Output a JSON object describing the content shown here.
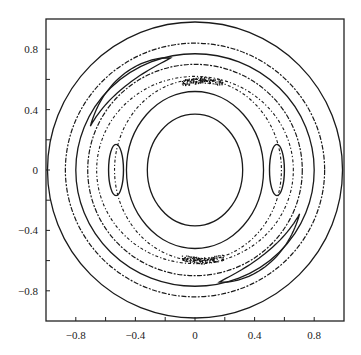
{
  "chart_data": {
    "type": "scatter",
    "title": "",
    "xlabel": "",
    "ylabel": "",
    "xlim": [
      -1.0,
      1.0
    ],
    "ylim": [
      -1.0,
      1.0
    ],
    "grid": false,
    "legend": null,
    "x_ticks": [
      -0.8,
      -0.6,
      -0.4,
      -0.2,
      0,
      0.2,
      0.4,
      0.6,
      0.8
    ],
    "x_tick_labels": [
      "−0.8",
      "−0.4",
      "0",
      "0.4",
      "0.8"
    ],
    "x_tick_label_values": [
      -0.8,
      -0.4,
      0,
      0.4,
      0.8
    ],
    "y_ticks": [
      -0.8,
      -0.6,
      -0.4,
      -0.2,
      0,
      0.2,
      0.4,
      0.6,
      0.8
    ],
    "y_tick_labels": [
      "0.8",
      "0.4",
      "0",
      "−0.4",
      "−0.8"
    ],
    "y_tick_label_values": [
      0.8,
      0.4,
      0,
      -0.4,
      -0.8
    ],
    "curves": [
      {
        "name": "inner-orbit-1",
        "style": "solid",
        "cx": 0.0,
        "cy": 0.0,
        "rx": 0.32,
        "ry": 0.37
      },
      {
        "name": "inner-orbit-2",
        "style": "solid",
        "cx": 0.0,
        "cy": 0.0,
        "rx": 0.46,
        "ry": 0.52
      },
      {
        "name": "separatrix-inner",
        "style": "dotted",
        "cx": 0.02,
        "cy": 0.0,
        "rx": 0.56,
        "ry": 0.6
      },
      {
        "name": "separatrix-outer",
        "style": "dotted",
        "cx": 0.0,
        "cy": 0.0,
        "rx": 0.66,
        "ry": 0.62
      },
      {
        "name": "ring-1",
        "style": "dashed",
        "cx": 0.0,
        "cy": 0.0,
        "rx": 0.72,
        "ry": 0.7
      },
      {
        "name": "ring-2",
        "style": "solid",
        "cx": 0.0,
        "cy": 0.0,
        "rx": 0.8,
        "ry": 0.77
      },
      {
        "name": "ring-3",
        "style": "dashed",
        "cx": 0.0,
        "cy": 0.0,
        "rx": 0.87,
        "ry": 0.84
      },
      {
        "name": "outer-orbit",
        "style": "solid",
        "cx": 0.0,
        "cy": 0.0,
        "rx": 0.99,
        "ry": 0.98
      }
    ],
    "islands": [
      {
        "name": "left-island",
        "cx": -0.53,
        "cy": 0.0,
        "rx": 0.05,
        "ry": 0.17
      },
      {
        "name": "right-island",
        "cx": 0.55,
        "cy": 0.0,
        "rx": 0.05,
        "ry": 0.17
      },
      {
        "name": "upper-left-crescent",
        "center_angle_deg": 130,
        "radius": 0.76,
        "span_deg": 55
      },
      {
        "name": "lower-right-crescent",
        "center_angle_deg": -50,
        "radius": 0.76,
        "span_deg": 55
      }
    ],
    "chaotic_clusters": [
      {
        "x": 0.05,
        "y": 0.6
      },
      {
        "x": 0.05,
        "y": -0.6
      }
    ]
  }
}
